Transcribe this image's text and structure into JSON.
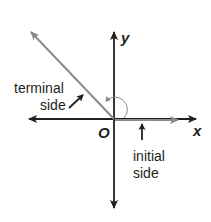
{
  "diagram": {
    "labels": {
      "x_axis": "x",
      "y_axis": "y",
      "origin": "O",
      "terminal_side_line1": "terminal",
      "terminal_side_line2": "side",
      "initial_side_line1": "initial",
      "initial_side_line2": "side"
    },
    "colors": {
      "axis": "#231f20",
      "ray": "#8a8a8a",
      "background": "#ffffff"
    },
    "icons": {
      "angle_arc": "counterclockwise-arc-arrow-icon",
      "terminal_pointer": "arrow-icon",
      "initial_pointer": "arrow-up-icon"
    }
  }
}
